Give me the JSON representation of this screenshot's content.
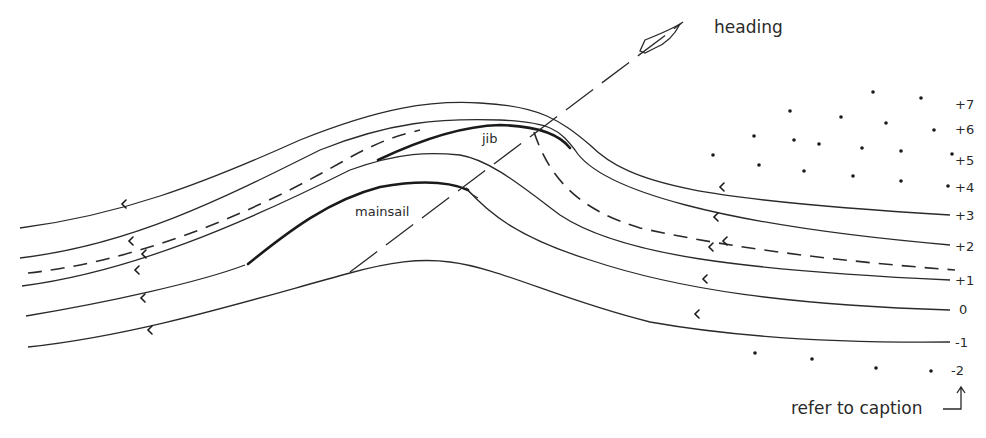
{
  "diagram": {
    "heading_label": "heading",
    "jib_label": "jib",
    "mainsail_label": "mainsail",
    "caption_ref": "refer to caption",
    "streamline_labels": [
      "+7",
      "+6",
      "+5",
      "+4",
      "+3",
      "+2",
      "+1",
      "0",
      "-1",
      "-2"
    ],
    "colors": {
      "ink": "#2a2a2a",
      "background": "#ffffff"
    }
  }
}
